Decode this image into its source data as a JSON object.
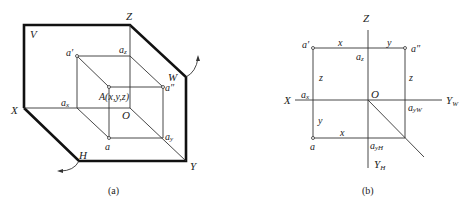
{
  "figure_a": {
    "caption": "(a)",
    "labels": {
      "V": "V",
      "Z": "Z",
      "W": "W",
      "X": "X",
      "H": "H",
      "Y": "Y",
      "O": "O",
      "a_prime": "a′",
      "a_z": "a",
      "a_z_sub": "z",
      "a_double_prime": "a″",
      "a_x": "a",
      "a_x_sub": "x",
      "a_y": "a",
      "a_y_sub": "y",
      "a": "a",
      "A": "A(x,y,z)"
    }
  },
  "figure_b": {
    "caption": "(b)",
    "labels": {
      "Z": "Z",
      "X": "X",
      "O": "O",
      "Y_W": "Y",
      "Y_W_sub": "W",
      "Y_H": "Y",
      "Y_H_sub": "H",
      "a_prime": "a′",
      "a_double_prime": "a″",
      "a": "a",
      "a_z": "a",
      "a_z_sub": "z",
      "a_x": "a",
      "a_x_sub": "x",
      "a_yW": "a",
      "a_yW_sub": "yW",
      "a_yH": "a",
      "a_yH_sub": "yH",
      "dim_x_top": "x",
      "dim_y_top": "y",
      "dim_z_left": "z",
      "dim_z_right": "z",
      "dim_y_left": "y",
      "dim_x_bottom": "x"
    }
  }
}
